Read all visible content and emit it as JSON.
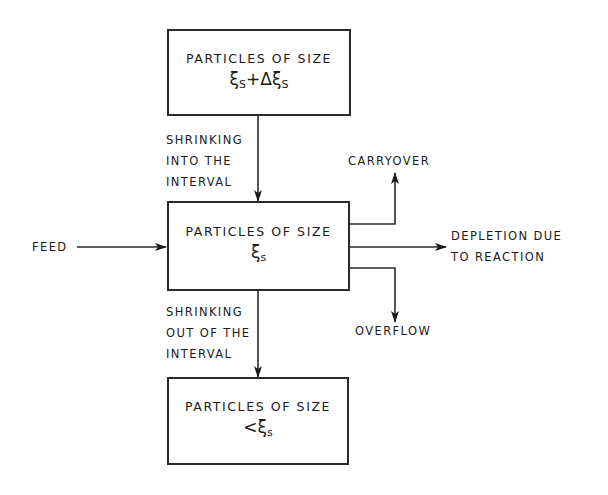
{
  "diagram": {
    "colors": {
      "line": "#2a2a2a",
      "text": "#1a1a1a",
      "background": "#ffffff"
    },
    "boxes": {
      "upper": {
        "title": "PARTICLES OF SIZE",
        "symbol": "ξ",
        "symbol_sub": "S",
        "symbol_mid": "+Δξ",
        "symbol_sub2": "S"
      },
      "middle": {
        "title": "PARTICLES OF SIZE",
        "symbol": "ξ",
        "symbol_sub": "s"
      },
      "lower": {
        "title": "PARTICLES OF SIZE",
        "symbol_prefix": "<",
        "symbol": "ξ",
        "symbol_sub": "s"
      }
    },
    "labels": {
      "shrinking_into": [
        "SHRINKING",
        "INTO THE",
        "INTERVAL"
      ],
      "shrinking_out": [
        "SHRINKING",
        "OUT OF THE",
        "INTERVAL"
      ],
      "feed": "FEED",
      "carryover": "CARRYOVER",
      "depletion": [
        "DEPLETION DUE",
        "TO REACTION"
      ],
      "overflow": "OVERFLOW"
    },
    "arrows": [
      {
        "from": "upper",
        "to": "middle",
        "label": "shrinking_into"
      },
      {
        "from": "feed",
        "to": "middle",
        "label": "feed"
      },
      {
        "from": "middle",
        "to": "carryover",
        "label": "carryover"
      },
      {
        "from": "middle",
        "to": "depletion",
        "label": "depletion"
      },
      {
        "from": "middle",
        "to": "overflow",
        "label": "overflow"
      },
      {
        "from": "middle",
        "to": "lower",
        "label": "shrinking_out"
      }
    ]
  }
}
